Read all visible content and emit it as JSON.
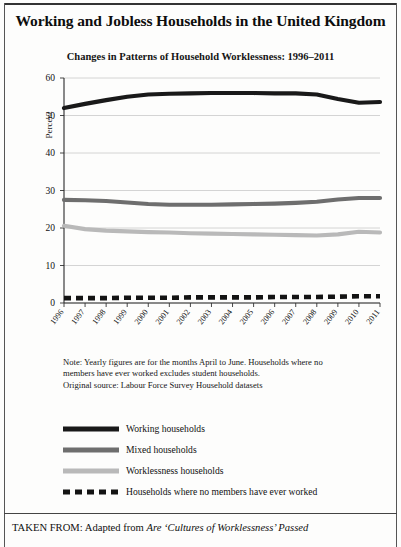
{
  "figure": {
    "main_title": "Working and Jobless Households in the United Kingdom",
    "sub_title": "Changes in Patterns of Household Worklessness: 1996–2011"
  },
  "notes": {
    "line1": "Note: Yearly figures are for the months April to June. Households where no",
    "line2": "members have ever worked excludes student households.",
    "line3": "Original source: Labour Force Survey Household datasets"
  },
  "legend": {
    "items": [
      {
        "label": "Working households",
        "color": "#191919",
        "style": "solid",
        "thickness": 5
      },
      {
        "label": "Mixed households",
        "color": "#6e6e6e",
        "style": "solid",
        "thickness": 5
      },
      {
        "label": "Worklessness households",
        "color": "#b9b9b9",
        "style": "solid",
        "thickness": 5
      },
      {
        "label": "Households where no members have ever worked",
        "color": "#131313",
        "style": "dashed",
        "thickness": 5
      }
    ]
  },
  "caption": {
    "prefix": "TAKEN FROM: Adapted from ",
    "italic_title": "Are ‘Cultures of Worklessness’ Passed",
    "clipped_next_line": "Down the Generations?"
  },
  "chart_data": {
    "type": "line",
    "title": "Changes in Patterns of Household Worklessness: 1996–2011",
    "xlabel": "",
    "ylabel": "Percent",
    "ylim": [
      0,
      60
    ],
    "yticks": [
      0,
      10,
      20,
      30,
      40,
      50,
      60
    ],
    "grid": "horizontal",
    "legend_position": "below-chart",
    "categories": [
      "1996",
      "1997",
      "1998",
      "1999",
      "2000",
      "2001",
      "2002",
      "2003",
      "2004",
      "2005",
      "2006",
      "2007",
      "2008",
      "2009",
      "2010",
      "2011"
    ],
    "series": [
      {
        "name": "Working households",
        "color": "#191919",
        "style": "solid",
        "values": [
          52.0,
          53.1,
          54.1,
          55.0,
          55.6,
          55.8,
          55.9,
          56.0,
          56.0,
          56.0,
          55.9,
          55.9,
          55.6,
          54.4,
          53.4,
          53.6
        ]
      },
      {
        "name": "Mixed households",
        "color": "#6e6e6e",
        "style": "solid",
        "values": [
          27.5,
          27.4,
          27.2,
          26.8,
          26.4,
          26.2,
          26.2,
          26.2,
          26.3,
          26.4,
          26.5,
          26.7,
          27.0,
          27.6,
          28.0,
          28.0
        ]
      },
      {
        "name": "Worklessness households",
        "color": "#b9b9b9",
        "style": "solid",
        "values": [
          20.6,
          19.7,
          19.3,
          19.1,
          18.9,
          18.8,
          18.6,
          18.5,
          18.4,
          18.3,
          18.2,
          18.1,
          18.0,
          18.3,
          19.0,
          18.8
        ]
      },
      {
        "name": "Households where no members have ever worked",
        "color": "#131313",
        "style": "dashed",
        "values": [
          1.3,
          1.3,
          1.3,
          1.4,
          1.4,
          1.4,
          1.5,
          1.5,
          1.5,
          1.5,
          1.6,
          1.6,
          1.6,
          1.7,
          1.8,
          1.8
        ]
      }
    ]
  }
}
